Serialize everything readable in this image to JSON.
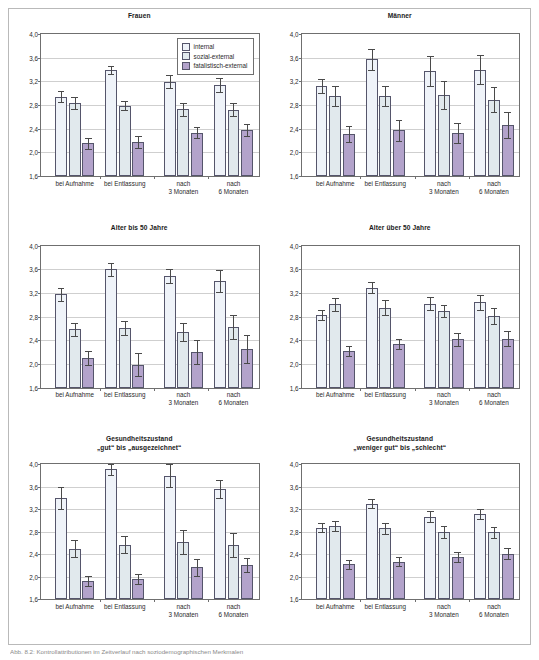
{
  "figure": {
    "caption": "Abb. 8.2: Kontrollattributionen im Zeitverlauf nach soziodemographischen Merkmalen",
    "axis": {
      "y_ticks": [
        "4,0",
        "3,6",
        "3,2",
        "2,8",
        "2,4",
        "2,0",
        "1,6"
      ],
      "y_min": 1.6,
      "y_max": 4.0,
      "y_step": 0.4
    },
    "legend": {
      "position": "top-right",
      "items": [
        {
          "label": "internal",
          "color": "#eff3f9",
          "key": "s1"
        },
        {
          "label": "sozial-external",
          "color": "#e1e9ed",
          "key": "s2"
        },
        {
          "label": "fatalistisch-external",
          "color": "#b3a3cb",
          "key": "s3"
        }
      ]
    },
    "categories": [
      {
        "line1": "bei Aufnahme",
        "line2": ""
      },
      {
        "line1": "bei Entlassung",
        "line2": ""
      },
      {
        "line1": "nach",
        "line2": "3 Monaten"
      },
      {
        "line1": "nach",
        "line2": "6 Monaten"
      }
    ]
  },
  "chart_data": [
    {
      "type": "bar",
      "title": "Frauen",
      "title_line2": "",
      "xlabel": "",
      "ylabel": "",
      "ylim": [
        1.6,
        4.0
      ],
      "grid": true,
      "categories": [
        "bei Aufnahme",
        "bei Entlassung",
        "nach 3 Monaten",
        "nach 6 Monaten"
      ],
      "series": [
        {
          "name": "internal",
          "values": [
            2.94,
            3.39,
            3.19,
            3.14
          ],
          "errors": [
            0.09,
            0.07,
            0.11,
            0.12
          ]
        },
        {
          "name": "sozial-external",
          "values": [
            2.83,
            2.79,
            2.73,
            2.72
          ],
          "errors": [
            0.1,
            0.08,
            0.11,
            0.11
          ]
        },
        {
          "name": "fatalistisch-external",
          "values": [
            2.15,
            2.17,
            2.33,
            2.38
          ],
          "errors": [
            0.09,
            0.1,
            0.09,
            0.1
          ]
        }
      ]
    },
    {
      "type": "bar",
      "title": "Männer",
      "title_line2": "",
      "xlabel": "",
      "ylabel": "",
      "ylim": [
        1.6,
        4.0
      ],
      "grid": true,
      "categories": [
        "bei Aufnahme",
        "bei Entlassung",
        "nach 3 Monaten",
        "nach 6 Monaten"
      ],
      "series": [
        {
          "name": "internal",
          "values": [
            3.12,
            3.57,
            3.37,
            3.4
          ],
          "errors": [
            0.12,
            0.18,
            0.25,
            0.24
          ]
        },
        {
          "name": "sozial-external",
          "values": [
            2.95,
            2.95,
            2.97,
            2.89
          ],
          "errors": [
            0.17,
            0.17,
            0.23,
            0.21
          ]
        },
        {
          "name": "fatalistisch-external",
          "values": [
            2.31,
            2.37,
            2.33,
            2.46
          ],
          "errors": [
            0.14,
            0.18,
            0.17,
            0.22
          ]
        }
      ]
    },
    {
      "type": "bar",
      "title": "Alter bis 50 Jahre",
      "title_line2": "",
      "xlabel": "",
      "ylabel": "",
      "ylim": [
        1.6,
        4.0
      ],
      "grid": true,
      "categories": [
        "bei Aufnahme",
        "bei Entlassung",
        "nach 3 Monaten",
        "nach 6 Monaten"
      ],
      "series": [
        {
          "name": "internal",
          "values": [
            3.18,
            3.6,
            3.49,
            3.4
          ],
          "errors": [
            0.11,
            0.11,
            0.12,
            0.19
          ]
        },
        {
          "name": "sozial-external",
          "values": [
            2.59,
            2.61,
            2.54,
            2.62
          ],
          "errors": [
            0.11,
            0.12,
            0.15,
            0.2
          ]
        },
        {
          "name": "fatalistisch-external",
          "values": [
            2.1,
            1.99,
            2.2,
            2.25
          ],
          "errors": [
            0.12,
            0.2,
            0.2,
            0.24
          ]
        }
      ]
    },
    {
      "type": "bar",
      "title": "Alter über 50 Jahre",
      "title_line2": "",
      "xlabel": "",
      "ylabel": "",
      "ylim": [
        1.6,
        4.0
      ],
      "grid": true,
      "categories": [
        "bei Aufnahme",
        "bei Entlassung",
        "nach 3 Monaten",
        "nach 6 Monaten"
      ],
      "series": [
        {
          "name": "internal",
          "values": [
            2.83,
            3.29,
            3.02,
            3.04
          ],
          "errors": [
            0.09,
            0.09,
            0.11,
            0.13
          ]
        },
        {
          "name": "sozial-external",
          "values": [
            3.01,
            2.95,
            2.9,
            2.81
          ],
          "errors": [
            0.11,
            0.13,
            0.1,
            0.13
          ]
        },
        {
          "name": "fatalistisch-external",
          "values": [
            2.22,
            2.34,
            2.42,
            2.43
          ],
          "errors": [
            0.08,
            0.09,
            0.11,
            0.13
          ]
        }
      ]
    },
    {
      "type": "bar",
      "title": "Gesundheitszustand",
      "title_line2": "„gut“ bis „ausgezeichnet“",
      "xlabel": "",
      "ylabel": "",
      "ylim": [
        1.6,
        4.0
      ],
      "grid": true,
      "categories": [
        "bei Aufnahme",
        "bei Entlassung",
        "nach 3 Monaten",
        "nach 6 Monaten"
      ],
      "series": [
        {
          "name": "internal",
          "values": [
            3.4,
            3.91,
            3.8,
            3.56
          ],
          "errors": [
            0.19,
            0.1,
            0.21,
            0.16
          ]
        },
        {
          "name": "sozial-external",
          "values": [
            2.5,
            2.57,
            2.62,
            2.57
          ],
          "errors": [
            0.15,
            0.15,
            0.22,
            0.21
          ]
        },
        {
          "name": "fatalistisch-external",
          "values": [
            1.93,
            1.96,
            2.17,
            2.21
          ],
          "errors": [
            0.09,
            0.09,
            0.15,
            0.13
          ]
        }
      ]
    },
    {
      "type": "bar",
      "title": "Gesundheitszustand",
      "title_line2": "„weniger gut“ bis „schlecht“",
      "xlabel": "",
      "ylabel": "",
      "ylim": [
        1.6,
        4.0
      ],
      "grid": true,
      "categories": [
        "bei Aufnahme",
        "bei Entlassung",
        "nach 3 Monaten",
        "nach 6 Monaten"
      ],
      "series": [
        {
          "name": "internal",
          "values": [
            2.87,
            3.3,
            3.07,
            3.11
          ],
          "errors": [
            0.08,
            0.08,
            0.1,
            0.09
          ]
        },
        {
          "name": "sozial-external",
          "values": [
            2.91,
            2.86,
            2.8,
            2.79
          ],
          "errors": [
            0.09,
            0.1,
            0.11,
            0.1
          ]
        },
        {
          "name": "fatalistisch-external",
          "values": [
            2.22,
            2.27,
            2.36,
            2.41
          ],
          "errors": [
            0.08,
            0.08,
            0.09,
            0.1
          ]
        }
      ]
    }
  ]
}
